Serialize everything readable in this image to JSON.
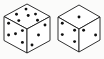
{
  "scene": {
    "title": "Two isometric dice",
    "background_color": "#fbfbfa",
    "line_color": "#1a1a1a",
    "pip_color": "#111111",
    "face_fill": "#ffffff",
    "object_count": 2
  },
  "dice": [
    {
      "name": "left-die",
      "label": "Left die",
      "total_visible_pips": 14,
      "faces": {
        "top": {
          "label": "top face",
          "pips": 6,
          "pattern": "3x2"
        },
        "left": {
          "label": "left face",
          "pips": 5,
          "pattern": "quincunx"
        },
        "right": {
          "label": "right face",
          "pips": 3,
          "pattern": "diagonal"
        }
      }
    },
    {
      "name": "right-die",
      "label": "Right die",
      "total_visible_pips": 7,
      "faces": {
        "top": {
          "label": "top face",
          "pips": 1,
          "pattern": "center"
        },
        "left": {
          "label": "left face",
          "pips": 4,
          "pattern": "corners"
        },
        "right": {
          "label": "right face",
          "pips": 2,
          "pattern": "diagonal"
        }
      }
    }
  ]
}
